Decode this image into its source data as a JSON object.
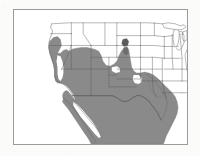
{
  "figure": {
    "kind": "species-range-map",
    "region": "Western North America",
    "title": "",
    "caption": "",
    "background_color": "#fbfbfa"
  },
  "map": {
    "frame": {
      "border_color": "#9a9a9a",
      "border_width_px": 1,
      "fill_color": "#ffffff",
      "x": 13,
      "y": 9,
      "width": 175,
      "height": 136
    },
    "land_outline_color": "#6d6d6d",
    "boundary_line_color": "#5a5a5a",
    "ocean_color": "#ffffff",
    "legend": {
      "present": false,
      "entries": [
        {
          "label": "Range",
          "color": "#8a8a8a",
          "swatch": "filled"
        },
        {
          "label": "Disjunct population",
          "color": "#5d5d5d",
          "swatch": "filled"
        }
      ]
    },
    "range": {
      "fill_color": "#8a8a8a",
      "outline_color": "#6f6f6f",
      "disjunct_fill_color": "#5d5d5d",
      "covered_regions": [
        "Pacific coast of Oregon",
        "Coastal and southern California",
        "Nevada",
        "Utah",
        "Arizona",
        "New Mexico",
        "Western Colorado",
        "Western and southern Texas",
        "Baja California peninsula",
        "Northern and central Mexico",
        "Gulf coast of Texas"
      ],
      "excluded_regions": [
        "California Central Valley",
        "Gulf of California",
        "Pacific Northwest interior",
        "Great Plains",
        "Midwest",
        "Eastern United States"
      ],
      "disjunct_patches": [
        "Central Colorado"
      ]
    },
    "unshaded_states_visible": [
      "Washington",
      "Idaho",
      "Montana",
      "Wyoming",
      "North Dakota",
      "South Dakota",
      "Nebraska",
      "Kansas",
      "Oklahoma",
      "Minnesota",
      "Iowa",
      "Missouri",
      "Arkansas",
      "Louisiana",
      "Wisconsin",
      "Illinois",
      "Michigan"
    ],
    "water_bodies": [
      "Pacific Ocean",
      "Gulf of California",
      "Gulf of Mexico",
      "Lake Michigan",
      "Lake Superior"
    ]
  }
}
